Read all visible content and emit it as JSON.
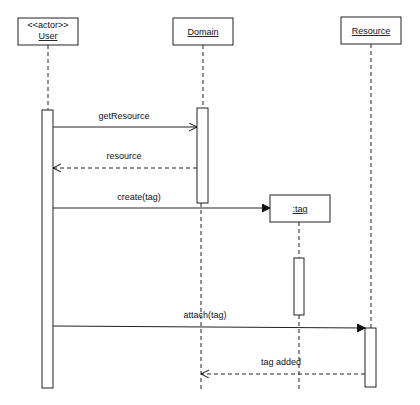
{
  "diagram": {
    "type": "sequence",
    "participants": [
      {
        "id": "user",
        "stereotype": "<<actor>>",
        "name": "User"
      },
      {
        "id": "domain",
        "stereotype": "",
        "name": "Domain"
      },
      {
        "id": "resource",
        "stereotype": "",
        "name": "Resource"
      },
      {
        "id": "tag",
        "stereotype": "",
        "name": ":tag"
      }
    ],
    "messages": [
      {
        "from": "User",
        "to": "Domain",
        "label": "getResource",
        "style": "sync"
      },
      {
        "from": "Domain",
        "to": "User",
        "label": "resource",
        "style": "return"
      },
      {
        "from": "User",
        "to": ":tag",
        "label": "create(tag)",
        "style": "create"
      },
      {
        "from": "User",
        "to": "Resource",
        "label": "attach(tag)",
        "style": "sync"
      },
      {
        "from": "Resource",
        "to": "Domain",
        "label": "tag added",
        "style": "return"
      }
    ]
  }
}
